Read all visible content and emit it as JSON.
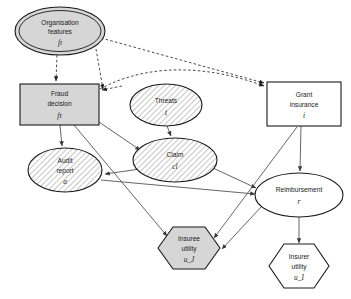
{
  "diagram": {
    "colors": {
      "fill_gray": "#d6d6d6",
      "fill_white": "#ffffff",
      "hatch_line": "#9a9a9a",
      "outline": "#1a1a1a",
      "edge_solid": "#4a4a4a",
      "edge_dashed": "#2b2b2b",
      "background": "#ffffff"
    },
    "nodes": [
      {
        "id": "organisation_features",
        "name": "organisation-features",
        "label_line1": "Organisation",
        "label_line2": "features",
        "symbol": "fı",
        "shape": "double-ellipse",
        "fill": "gray",
        "hatched": false,
        "cx": 60,
        "cy": 31,
        "rx": 44,
        "ry": 23
      },
      {
        "id": "fraud_decision",
        "name": "fraud-decision",
        "label_line1": "Fraud",
        "label_line2": "decision",
        "symbol": "fτ",
        "shape": "rectangle",
        "fill": "gray",
        "hatched": false,
        "x": 20,
        "y": 84,
        "w": 79,
        "h": 41
      },
      {
        "id": "threats",
        "name": "threats",
        "label_line1": "Threats",
        "label_line2": "",
        "symbol": "t",
        "shape": "ellipse",
        "fill": "hatched",
        "hatched": true,
        "cx": 166,
        "cy": 105,
        "rx": 36,
        "ry": 21
      },
      {
        "id": "grant_insurance",
        "name": "grant-insurance",
        "label_line1": "Grant",
        "label_line2": "insurance",
        "symbol": "i",
        "shape": "rectangle",
        "fill": "white",
        "hatched": false,
        "x": 267,
        "y": 82,
        "w": 74,
        "h": 44
      },
      {
        "id": "claim",
        "name": "claim",
        "label_line1": "Claim",
        "label_line2": "",
        "symbol": "cl",
        "shape": "ellipse",
        "fill": "hatched",
        "hatched": true,
        "cx": 175,
        "cy": 160,
        "rx": 42,
        "ry": 22
      },
      {
        "id": "audit_report",
        "name": "audit-report",
        "label_line1": "Audit",
        "label_line2": "report",
        "symbol": "a",
        "shape": "ellipse",
        "fill": "hatched",
        "hatched": true,
        "cx": 65,
        "cy": 170,
        "rx": 37,
        "ry": 22
      },
      {
        "id": "reimbursement",
        "name": "reimbursement",
        "label_line1": "Reimbursement",
        "label_line2": "",
        "symbol": "r",
        "shape": "ellipse",
        "fill": "white",
        "hatched": false,
        "cx": 299,
        "cy": 195,
        "rx": 44,
        "ry": 22
      },
      {
        "id": "insuree_utility",
        "name": "insuree-utility",
        "label_line1": "Insuree",
        "label_line2": "utility",
        "symbol": "u_J",
        "shape": "hexagon",
        "fill": "gray",
        "hatched": false,
        "cx": 189,
        "cy": 248,
        "w": 62,
        "h": 43
      },
      {
        "id": "insurer_utility",
        "name": "insurer-utility",
        "label_line1": "Insurer",
        "label_line2": "utility",
        "symbol": "u_I",
        "shape": "hexagon",
        "fill": "white",
        "hatched": false,
        "cx": 299,
        "cy": 266,
        "w": 60,
        "h": 44
      }
    ],
    "edges": [
      {
        "from": "organisation_features",
        "to": "fraud_decision",
        "style": "dashed"
      },
      {
        "from": "organisation_features",
        "to": "grant_insurance",
        "style": "dashed"
      },
      {
        "from": "organisation_features",
        "to": "threats_area",
        "style": "dashed"
      },
      {
        "from": "threats_area",
        "to": "grant_insurance",
        "style": "dashed"
      },
      {
        "from": "threats",
        "to": "claim",
        "style": "solid"
      },
      {
        "from": "fraud_decision",
        "to": "audit_report",
        "style": "solid"
      },
      {
        "from": "fraud_decision",
        "to": "claim",
        "style": "solid"
      },
      {
        "from": "fraud_decision",
        "to": "insuree_utility",
        "style": "solid"
      },
      {
        "from": "claim",
        "to": "audit_report",
        "style": "solid"
      },
      {
        "from": "claim",
        "to": "reimbursement",
        "style": "solid"
      },
      {
        "from": "audit_report",
        "to": "reimbursement",
        "style": "solid"
      },
      {
        "from": "grant_insurance",
        "to": "reimbursement",
        "style": "solid"
      },
      {
        "from": "grant_insurance",
        "to": "insuree_utility",
        "style": "solid"
      },
      {
        "from": "reimbursement",
        "to": "insurer_utility",
        "style": "solid"
      },
      {
        "from": "reimbursement",
        "to": "insuree_utility",
        "style": "solid"
      }
    ]
  }
}
